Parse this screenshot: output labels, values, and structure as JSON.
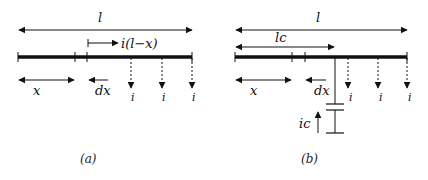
{
  "figure": {
    "panel_a": {
      "caption": "(a)",
      "labels": {
        "total_length": "l",
        "current_right": "i(l−x)",
        "position": "x",
        "element": "dx",
        "tap_current": "i"
      }
    },
    "panel_b": {
      "caption": "(b)",
      "labels": {
        "total_length": "l",
        "capacitor_position": "lc",
        "position": "x",
        "element": "dx",
        "tap_current": "i",
        "capacitor_current": "ic"
      }
    },
    "colors": {
      "line": "#111111",
      "background": "#ffffff"
    }
  }
}
